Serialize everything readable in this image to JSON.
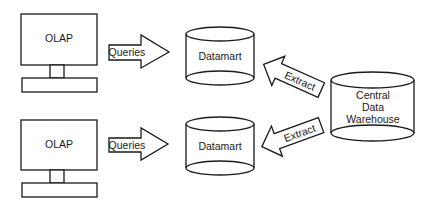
{
  "diagram": {
    "type": "data-warehouse-architecture",
    "colors": {
      "stroke": "#1a1a1a",
      "fill": "#ffffff",
      "text": "#1a1a1a"
    },
    "clients": [
      {
        "label": "OLAP"
      },
      {
        "label": "OLAP"
      }
    ],
    "query_arrows": [
      {
        "label": "Queries"
      },
      {
        "label": "Queries"
      }
    ],
    "datamarts": [
      {
        "label": "Datamart"
      },
      {
        "label": "Datamart"
      }
    ],
    "extract_arrows": [
      {
        "label": "Extract"
      },
      {
        "label": "Extract"
      }
    ],
    "warehouse": {
      "lines": [
        "Central",
        "Data",
        "Warehouse"
      ]
    }
  }
}
